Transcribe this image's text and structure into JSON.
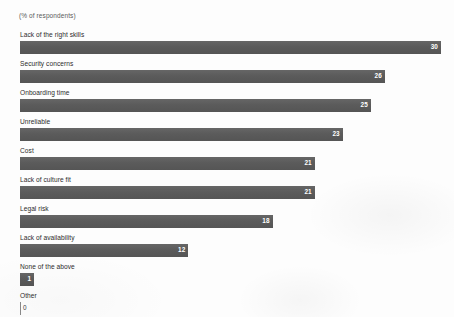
{
  "chart_data": {
    "type": "bar",
    "orientation": "horizontal",
    "title": "",
    "subtitle": "(% of respondents)",
    "xlabel": "",
    "ylabel": "",
    "axis_note": "(% of respondents)",
    "grid": false,
    "legend": "none",
    "xlim": [
      0,
      30
    ],
    "value_suffix": "",
    "bar_color": "#5e5e5e",
    "value_label_color": "#ffffff",
    "categories": [
      "Lack of the right skills",
      "Security concerns",
      "Onboarding time",
      "Unreliable",
      "Cost",
      "Lack of culture fit",
      "Legal risk",
      "Lack of availability",
      "None of the above",
      "Other"
    ],
    "values": [
      30,
      26,
      25,
      23,
      21,
      21,
      18,
      12,
      1,
      0
    ],
    "bars": [
      {
        "label": "Lack of the right skills",
        "value": 30,
        "value_text": "30"
      },
      {
        "label": "Security concerns",
        "value": 26,
        "value_text": "26"
      },
      {
        "label": "Onboarding time",
        "value": 25,
        "value_text": "25"
      },
      {
        "label": "Unreliable",
        "value": 23,
        "value_text": "23"
      },
      {
        "label": "Cost",
        "value": 21,
        "value_text": "21"
      },
      {
        "label": "Lack of culture fit",
        "value": 21,
        "value_text": "21"
      },
      {
        "label": "Legal risk",
        "value": 18,
        "value_text": "18"
      },
      {
        "label": "Lack of availability",
        "value": 12,
        "value_text": "12"
      },
      {
        "label": "None of the above",
        "value": 1,
        "value_text": "1"
      },
      {
        "label": "Other",
        "value": 0,
        "value_text": "0"
      }
    ]
  }
}
